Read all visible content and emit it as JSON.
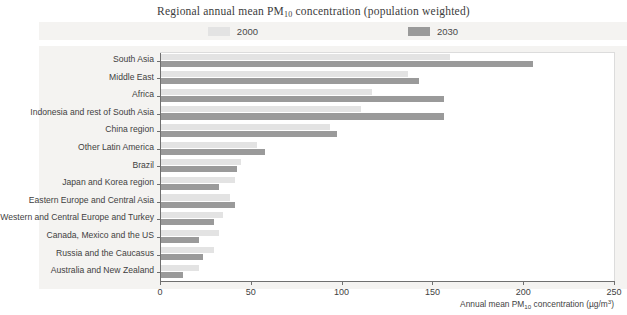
{
  "chart_data": {
    "type": "bar",
    "orientation": "horizontal",
    "title": "Regional annual mean PM10 concentration (population weighted)",
    "title_prefix": "Regional annual mean PM",
    "title_sub": "10",
    "title_suffix": " concentration (population weighted)",
    "xlabel_prefix": "Annual mean PM",
    "xlabel_sub": "10",
    "xlabel_mid": " concentration (µg/m",
    "xlabel_sup": "3",
    "xlabel_suffix": ")",
    "ylabel": "",
    "xlim": [
      0,
      250
    ],
    "xticks": [
      "0",
      "50",
      "100",
      "150",
      "200",
      "250"
    ],
    "grid": false,
    "legend_position": "top-center",
    "categories": [
      "South Asia",
      "Middle East",
      "Africa",
      "Indonesia and rest of South Asia",
      "China region",
      "Other Latin America",
      "Brazil",
      "Japan and Korea region",
      "Eastern Europe and Central Asia",
      "Western and Central Europe and Turkey",
      "Canada, Mexico and the US",
      "Russia and the Caucasus",
      "Australia and New Zealand"
    ],
    "series": [
      {
        "name": "2000",
        "color": "#e3e3e3",
        "values": [
          159,
          136,
          116,
          110,
          93,
          53,
          44,
          41,
          38,
          34,
          32,
          29,
          21
        ]
      },
      {
        "name": "2030",
        "color": "#9a9a9a",
        "values": [
          205,
          142,
          156,
          156,
          97,
          57,
          42,
          32,
          41,
          29,
          21,
          23,
          12
        ]
      }
    ]
  },
  "legend": {
    "items": [
      {
        "label": "2000",
        "swatch": "y2000"
      },
      {
        "label": "2030",
        "swatch": "y2030"
      }
    ]
  }
}
